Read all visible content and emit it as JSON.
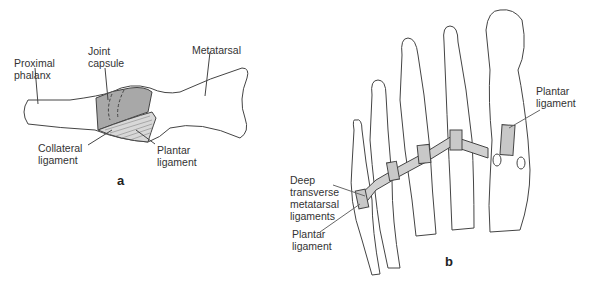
{
  "panel_a": {
    "letter": "a",
    "labels": {
      "proximal_phalanx": "Proximal\nphalanx",
      "joint_capsule": "Joint\ncapsule",
      "metatarsal": "Metatarsal",
      "collateral_ligament": "Collateral\nligament",
      "plantar_ligament": "Plantar\nligament"
    }
  },
  "panel_b": {
    "letter": "b",
    "labels": {
      "deep_transverse": "Deep\ntransverse\nmetatarsal\nligaments",
      "plantar_ligament_bottom": "Plantar\nligament",
      "plantar_ligament_top": "Plantar\nligament"
    }
  },
  "colors": {
    "line": "#444444",
    "shade": "#a8a8a8",
    "ligament": "#d0d0d0",
    "text": "#333333"
  }
}
